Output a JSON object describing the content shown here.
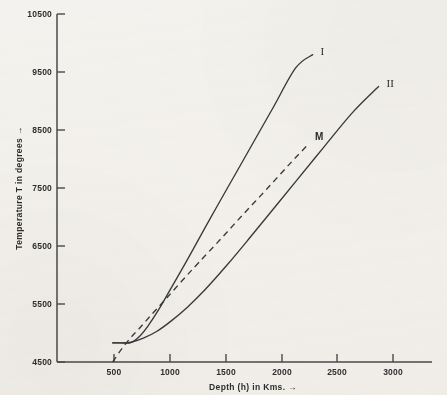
{
  "chart_data": {
    "type": "line",
    "title": "",
    "xlabel": "Depth (h) in Kms. →",
    "ylabel": "Temperature T in degrees →",
    "xlim": [
      0,
      3300
    ],
    "ylim": [
      4500,
      10500
    ],
    "xticks": [
      500,
      1000,
      1500,
      2000,
      2500,
      3000
    ],
    "yticks": [
      4500,
      5500,
      6500,
      7500,
      8500,
      9500,
      10500
    ],
    "xtick_labels": [
      "500",
      "1000",
      "1500",
      "2000",
      "2500",
      "3000"
    ],
    "ytick_labels": [
      "4500",
      "5500",
      "6500",
      "7500",
      "8500",
      "9500",
      "10500"
    ],
    "grid": false,
    "legend": "inline-curve-labels",
    "series": [
      {
        "name": "I",
        "label": "I",
        "style": "solid",
        "color": "#3a3a3a",
        "x": [
          490,
          560,
          650,
          720,
          800,
          900,
          1000,
          1100,
          1200,
          1350,
          1500,
          1700,
          1900,
          2100,
          2250
        ],
        "y": [
          4830,
          4830,
          4835,
          4930,
          5120,
          5420,
          5760,
          6100,
          6450,
          6980,
          7500,
          8190,
          8880,
          9570,
          9800
        ]
      },
      {
        "name": "II",
        "label": "II",
        "style": "solid",
        "color": "#3a3a3a",
        "x": [
          490,
          560,
          650,
          760,
          880,
          1000,
          1150,
          1300,
          1500,
          1700,
          1900,
          2100,
          2350,
          2600,
          2830
        ],
        "y": [
          4830,
          4830,
          4840,
          4910,
          5030,
          5200,
          5450,
          5740,
          6180,
          6650,
          7130,
          7610,
          8210,
          8800,
          9250
        ]
      },
      {
        "name": "M",
        "label": "M",
        "style": "dashed",
        "color": "#3a3a3a",
        "x": [
          490,
          560,
          640,
          720,
          820,
          950,
          1100,
          1250,
          1450,
          1650,
          1850,
          2050,
          2200
        ],
        "y": [
          4500,
          4700,
          4900,
          5070,
          5290,
          5570,
          5900,
          6220,
          6640,
          7070,
          7490,
          7920,
          8230
        ]
      }
    ],
    "annotations": [
      {
        "name": "curve-label-i",
        "text": "I",
        "x": 2320,
        "y": 9790
      },
      {
        "name": "curve-label-ii",
        "text": "II",
        "x": 2900,
        "y": 9250
      },
      {
        "name": "curve-label-m",
        "text": "M",
        "x": 2270,
        "y": 8320
      }
    ]
  },
  "axes": {
    "y_title": "Temperature T in degrees →",
    "x_title": "Depth (h) in Kms. →"
  }
}
